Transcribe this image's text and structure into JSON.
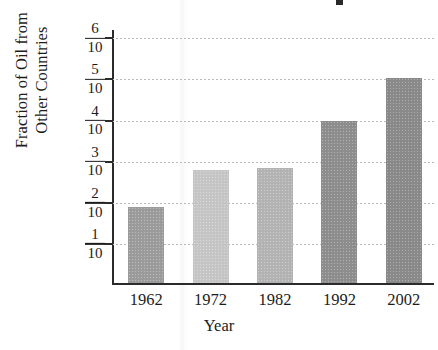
{
  "figure": {
    "background_color": "#ffffff",
    "axis_color": "#2b2b2b",
    "grid_color": "#b9b9b9",
    "title_fragment_visible": true
  },
  "chart_data": {
    "type": "bar",
    "title": "",
    "xlabel": "Year",
    "ylabel": "Fraction of Oil from\nOther Countries",
    "categories": [
      "1962",
      "1972",
      "1982",
      "1992",
      "2002"
    ],
    "values": [
      0.185,
      0.275,
      0.28,
      0.395,
      0.5
    ],
    "value_labels": [
      "",
      "",
      "",
      "",
      ""
    ],
    "ylim": [
      0,
      0.62
    ],
    "ytick_values": [
      0.1,
      0.2,
      0.3,
      0.4,
      0.5,
      0.6
    ],
    "ytick_labels": [
      {
        "numerator": "1",
        "denominator": "10"
      },
      {
        "numerator": "2",
        "denominator": "10"
      },
      {
        "numerator": "3",
        "denominator": "10"
      },
      {
        "numerator": "4",
        "denominator": "10"
      },
      {
        "numerator": "5",
        "denominator": "10"
      },
      {
        "numerator": "6",
        "denominator": "10"
      }
    ],
    "bar_colors": [
      "#9c9c9c",
      "#c6c6c6",
      "#b4b4b4",
      "#8e8e8e",
      "#8a8a8a"
    ],
    "grid": true,
    "grid_axis": "y",
    "grid_style": "dotted",
    "legend": false,
    "legend_position": "none"
  }
}
